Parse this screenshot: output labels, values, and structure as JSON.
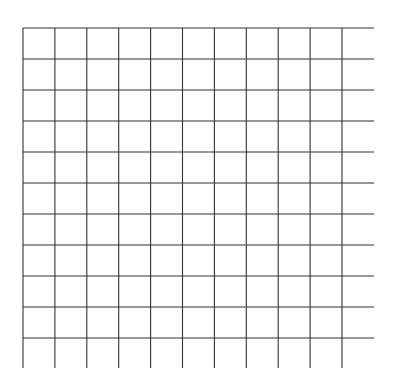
{
  "grid": {
    "line_color": "#333333",
    "background": "#ffffff",
    "vertical_lines_x": [
      23,
      54.9,
      86.8,
      118.7,
      150.6,
      182.5,
      214.4,
      246.3,
      278.2,
      310.1,
      342
    ],
    "vertical_y_start": 28,
    "vertical_y_end": 368,
    "horizontal_lines_y": [
      28,
      59,
      90,
      121,
      152,
      183,
      214,
      245,
      276,
      307,
      338
    ],
    "horizontal_x_start": 23,
    "horizontal_x_end": 374,
    "columns": 11,
    "rows": 11
  }
}
